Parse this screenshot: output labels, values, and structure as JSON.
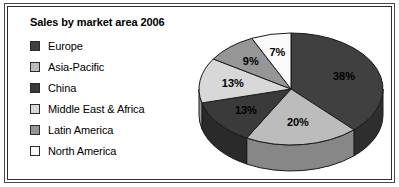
{
  "chart_data": {
    "type": "pie",
    "title": "Sales by market area 2006",
    "categories": [
      "Europe",
      "Asia-Pacific",
      "China",
      "Middle East & Africa",
      "Latin America",
      "North America"
    ],
    "values": [
      38,
      20,
      13,
      13,
      9,
      7
    ],
    "value_labels": [
      "38%",
      "20%",
      "13%",
      "13%",
      "9%",
      "7%"
    ],
    "unit": "%",
    "colors": [
      "#404040",
      "#bcbcbc",
      "#3a3a3a",
      "#d8d8d8",
      "#969696",
      "#fafafa"
    ],
    "legend_position": "left",
    "three_d": true,
    "start_angle_deg": 0,
    "direction": "clockwise",
    "grid": false,
    "xlabel": "",
    "ylabel": ""
  },
  "chart": {
    "title": "Sales by market area 2006",
    "legend": {
      "items": [
        {
          "label": "Europe",
          "color": "#404040",
          "value_label": "38%"
        },
        {
          "label": "Asia-Pacific",
          "color": "#bcbcbc",
          "value_label": "20%"
        },
        {
          "label": "China",
          "color": "#3a3a3a",
          "value_label": "13%"
        },
        {
          "label": "Middle East & Africa",
          "color": "#d8d8d8",
          "value_label": "13%"
        },
        {
          "label": "Latin America",
          "color": "#969696",
          "value_label": "9%"
        },
        {
          "label": "North America",
          "color": "#fafafa",
          "value_label": "7%"
        }
      ]
    },
    "slice_labels": {
      "europe": "38%",
      "asia_pacific": "20%",
      "china": "13%",
      "middle_east_africa": "13%",
      "latin_america": "9%",
      "north_america": "7%"
    }
  }
}
